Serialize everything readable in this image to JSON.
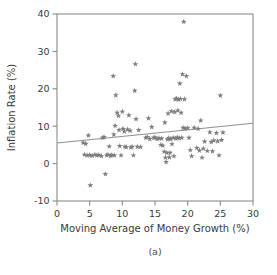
{
  "figure": {
    "caption": "(a)",
    "marker_color": "#7d7d7d",
    "frame_color": "#8a8a8a",
    "line_color": "#8f8f8f",
    "text_color": "#3a3a3a"
  },
  "chart_data": {
    "type": "scatter",
    "title": "",
    "subtitle": "",
    "caption": "(a)",
    "xlabel": "Moving Average of Money Growth (%)",
    "ylabel": "Inflation Rate (%)",
    "xlim": [
      0,
      30
    ],
    "ylim": [
      -10,
      40
    ],
    "xticks": [
      0,
      5,
      10,
      15,
      20,
      25,
      30
    ],
    "yticks": [
      -10,
      0,
      10,
      20,
      30,
      40
    ],
    "xtick_labels": [
      "0",
      "5",
      "10",
      "15",
      "20",
      "25",
      "30"
    ],
    "ytick_labels": [
      "-10",
      "0",
      "10",
      "20",
      "30",
      "40"
    ],
    "grid": false,
    "legend": null,
    "legend_position": "none",
    "marker": "star",
    "fit_line": {
      "type": "linear-regression",
      "x_start": 0,
      "y_start": 5.5,
      "x_end": 30,
      "y_end": 10.8,
      "slope": 0.177,
      "intercept": 5.5
    },
    "points": [
      [
        4.0,
        5.6
      ],
      [
        4.2,
        2.4
      ],
      [
        4.4,
        5.3
      ],
      [
        4.6,
        2.2
      ],
      [
        4.8,
        7.5
      ],
      [
        5.0,
        2.3
      ],
      [
        5.1,
        -5.8
      ],
      [
        5.4,
        2.1
      ],
      [
        5.8,
        2.4
      ],
      [
        6.1,
        2.2
      ],
      [
        6.4,
        2.3
      ],
      [
        6.8,
        2.0
      ],
      [
        7.0,
        6.9
      ],
      [
        7.2,
        7.1
      ],
      [
        7.4,
        -2.8
      ],
      [
        7.6,
        2.2
      ],
      [
        7.8,
        2.4
      ],
      [
        8.0,
        4.6
      ],
      [
        8.2,
        2.1
      ],
      [
        8.4,
        2.3
      ],
      [
        8.6,
        23.4
      ],
      [
        8.7,
        7.8
      ],
      [
        8.8,
        2.2
      ],
      [
        8.9,
        10.1
      ],
      [
        9.0,
        18.3
      ],
      [
        9.2,
        13.6
      ],
      [
        9.4,
        12.8
      ],
      [
        9.5,
        9.0
      ],
      [
        9.6,
        4.7
      ],
      [
        9.8,
        2.2
      ],
      [
        10.0,
        13.9
      ],
      [
        10.1,
        9.3
      ],
      [
        10.3,
        8.6
      ],
      [
        10.4,
        4.5
      ],
      [
        10.6,
        4.4
      ],
      [
        10.8,
        9.1
      ],
      [
        11.0,
        12.9
      ],
      [
        11.2,
        8.8
      ],
      [
        11.3,
        4.3
      ],
      [
        11.5,
        4.5
      ],
      [
        11.7,
        2.2
      ],
      [
        11.9,
        19.5
      ],
      [
        12.0,
        26.6
      ],
      [
        12.1,
        11.9
      ],
      [
        12.3,
        4.5
      ],
      [
        12.5,
        9.0
      ],
      [
        12.8,
        4.4
      ],
      [
        13.6,
        6.9
      ],
      [
        13.8,
        7.1
      ],
      [
        14.0,
        12.1
      ],
      [
        14.2,
        6.6
      ],
      [
        14.5,
        9.8
      ],
      [
        14.8,
        6.9
      ],
      [
        15.0,
        7.0
      ],
      [
        15.3,
        6.6
      ],
      [
        15.6,
        6.8
      ],
      [
        15.9,
        5.0
      ],
      [
        16.0,
        6.7
      ],
      [
        16.2,
        4.8
      ],
      [
        16.4,
        3.2
      ],
      [
        16.5,
        11.0
      ],
      [
        16.6,
        1.6
      ],
      [
        16.7,
        0.4
      ],
      [
        16.8,
        2.9
      ],
      [
        16.9,
        6.5
      ],
      [
        17.0,
        13.4
      ],
      [
        17.1,
        6.8
      ],
      [
        17.2,
        1.7
      ],
      [
        17.3,
        2.9
      ],
      [
        17.4,
        6.6
      ],
      [
        17.5,
        14.0
      ],
      [
        17.6,
        5.2
      ],
      [
        17.8,
        6.9
      ],
      [
        17.9,
        2.0
      ],
      [
        18.0,
        13.8
      ],
      [
        18.1,
        17.2
      ],
      [
        18.2,
        6.7
      ],
      [
        18.3,
        17.4
      ],
      [
        18.4,
        7.0
      ],
      [
        18.5,
        14.2
      ],
      [
        18.6,
        17.1
      ],
      [
        18.7,
        6.8
      ],
      [
        18.8,
        21.4
      ],
      [
        18.9,
        17.3
      ],
      [
        19.0,
        13.6
      ],
      [
        19.1,
        6.9
      ],
      [
        19.2,
        23.9
      ],
      [
        19.3,
        9.6
      ],
      [
        19.4,
        37.9
      ],
      [
        19.5,
        17.2
      ],
      [
        19.6,
        9.4
      ],
      [
        19.8,
        23.4
      ],
      [
        20.0,
        9.5
      ],
      [
        20.2,
        6.9
      ],
      [
        20.4,
        3.6
      ],
      [
        20.6,
        2.0
      ],
      [
        21.0,
        9.6
      ],
      [
        21.4,
        4.2
      ],
      [
        21.6,
        9.3
      ],
      [
        21.8,
        3.5
      ],
      [
        22.0,
        11.5
      ],
      [
        22.2,
        1.6
      ],
      [
        22.4,
        4.0
      ],
      [
        22.6,
        5.9
      ],
      [
        23.0,
        3.4
      ],
      [
        23.4,
        8.4
      ],
      [
        23.6,
        5.8
      ],
      [
        23.8,
        3.3
      ],
      [
        24.0,
        6.2
      ],
      [
        24.4,
        8.2
      ],
      [
        24.6,
        6.0
      ],
      [
        24.8,
        2.2
      ],
      [
        25.0,
        18.2
      ],
      [
        25.2,
        6.3
      ],
      [
        25.4,
        8.3
      ]
    ]
  }
}
